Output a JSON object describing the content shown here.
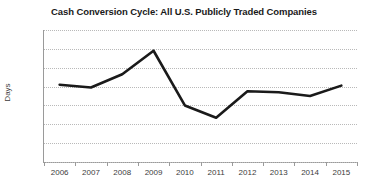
{
  "chart_data": {
    "type": "line",
    "title": "Cash Conversion Cycle: All U.S. Publicly Traded Companies",
    "xlabel": "",
    "ylabel": "Days",
    "categories": [
      "2006",
      "2007",
      "2008",
      "2009",
      "2010",
      "2011",
      "2012",
      "2013",
      "2014",
      "2015"
    ],
    "values": [
      62.2,
      61.9,
      63.3,
      65.8,
      60.0,
      58.7,
      61.5,
      61.4,
      61.0,
      62.1
    ],
    "series": [
      {
        "name": "Cash Conversion Cycle",
        "values": [
          62.2,
          61.9,
          63.3,
          65.8,
          60.0,
          58.7,
          61.5,
          61.4,
          61.0,
          62.1
        ]
      }
    ],
    "ylim": [
      54,
      68
    ],
    "yticks": [
      68,
      66,
      64,
      62,
      60,
      58,
      56,
      54
    ],
    "xticks": [
      "2006",
      "2007",
      "2008",
      "2009",
      "2010",
      "2011",
      "2012",
      "2013",
      "2014",
      "2015"
    ],
    "grid": "horizontal-dotted",
    "legend": "none",
    "line_color": "#1a1a1a",
    "grid_color": "#b9b9b9",
    "axis_color": "#9a9a9a",
    "background_color": "#ffffff"
  }
}
